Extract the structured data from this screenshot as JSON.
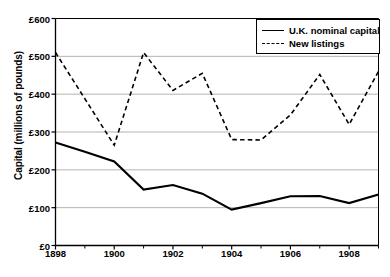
{
  "chart_data": {
    "type": "line",
    "title": "",
    "xlabel": "",
    "ylabel": "Capital (millions of pounds)",
    "x": [
      1898,
      1899,
      1900,
      1901,
      1902,
      1903,
      1904,
      1905,
      1906,
      1907,
      1908,
      1909
    ],
    "xlim": [
      1898,
      1909
    ],
    "ylim": [
      0,
      600
    ],
    "grid": true,
    "legend_position": "top-right",
    "x_tick_labels": [
      "1898",
      "1900",
      "1902",
      "1904",
      "1906",
      "1908"
    ],
    "x_tick_values": [
      1898,
      1900,
      1902,
      1904,
      1906,
      1908
    ],
    "x_minor_ticks": [
      1899,
      1901,
      1903,
      1905,
      1907,
      1909
    ],
    "y_tick_labels": [
      "£0",
      "£100",
      "£200",
      "£300",
      "£400",
      "£500",
      "£600"
    ],
    "y_tick_values": [
      0,
      100,
      200,
      300,
      400,
      500,
      600
    ],
    "series": [
      {
        "name": "U.K. nominal capital",
        "style": "solid",
        "color": "#000000",
        "values": [
          272,
          248,
          222,
          148,
          160,
          137,
          95,
          112,
          130,
          131,
          112,
          135
        ]
      },
      {
        "name": "New listings",
        "style": "dashed",
        "color": "#000000",
        "values": [
          510,
          388,
          265,
          510,
          410,
          455,
          280,
          279,
          345,
          452,
          320,
          460
        ]
      }
    ]
  },
  "legend": {
    "items": [
      {
        "label": "U.K. nominal capital",
        "style": "solid"
      },
      {
        "label": "New listings",
        "style": "dashed"
      }
    ]
  },
  "colors": {
    "axis": "#000000",
    "grid": "#b3b3b3",
    "line": "#000000",
    "background": "#ffffff"
  }
}
